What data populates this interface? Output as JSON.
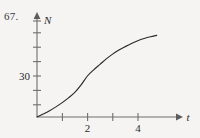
{
  "figure": {
    "problem_number": "67.",
    "background_color": "#f5f4f2",
    "curve_color": "#2a2a2a",
    "axis_color": "#6e6e6e"
  },
  "chart_data": {
    "type": "line",
    "title": "",
    "subtitle": "",
    "xlabel": "t",
    "ylabel": "N",
    "xlim": [
      0,
      5.7
    ],
    "ylim": [
      0,
      75
    ],
    "grid": false,
    "legend": null,
    "x_ticks": [
      1,
      2,
      3,
      4
    ],
    "x_tick_labels": [
      "",
      "2",
      "",
      "4"
    ],
    "y_ticks": [
      10,
      20,
      30,
      40,
      50,
      60,
      70
    ],
    "y_tick_labels": [
      "",
      "",
      "30",
      "",
      "",
      "",
      ""
    ],
    "annotations": [],
    "series": [
      {
        "name": "N(t)",
        "shape": "logistic-growth",
        "x": [
          0,
          0.25,
          0.5,
          0.75,
          1,
          1.25,
          1.5,
          1.75,
          2,
          2.25,
          2.5,
          2.75,
          3,
          3.25,
          3.5,
          3.75,
          4,
          4.25,
          4.5,
          4.75
        ],
        "y": [
          0,
          2.2,
          4.6,
          7.4,
          10.5,
          14.0,
          18.0,
          23.5,
          30.0,
          34.5,
          38.5,
          42.5,
          46.0,
          49.0,
          51.5,
          53.8,
          55.8,
          57.4,
          58.7,
          59.7
        ]
      }
    ]
  }
}
